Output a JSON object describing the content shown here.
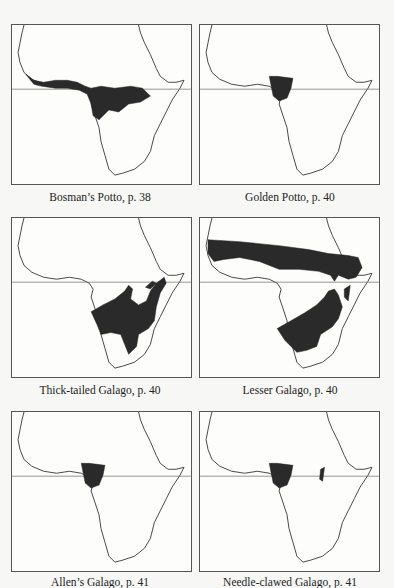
{
  "figure": {
    "type": "species range maps of Africa",
    "panels": [
      {
        "id": "bosmans-potto",
        "caption": "Bosman’s Potto, p. 38",
        "range": "West and Central African forest belt, north of and along equator"
      },
      {
        "id": "golden-potto",
        "caption": "Golden Potto, p. 40",
        "range": "Small block in Cameroon/Gabon area straddling equator"
      },
      {
        "id": "thick-tailed-galago",
        "caption": "Thick-tailed Galago, p. 40",
        "range": "East and south-central Africa"
      },
      {
        "id": "lesser-galago",
        "caption": "Lesser Galago, p. 40",
        "range": "Sahel savanna band and southern Africa"
      },
      {
        "id": "allens-galago",
        "caption": "Allen’s Galago, p. 41",
        "range": "Small block in Cameroon/Gabon area"
      },
      {
        "id": "needle-clawed-galago",
        "caption": "Needle-clawed Galago, p. 41",
        "range": "Cameroon/Gabon block plus small eastern patch"
      }
    ],
    "equator_line": true
  }
}
